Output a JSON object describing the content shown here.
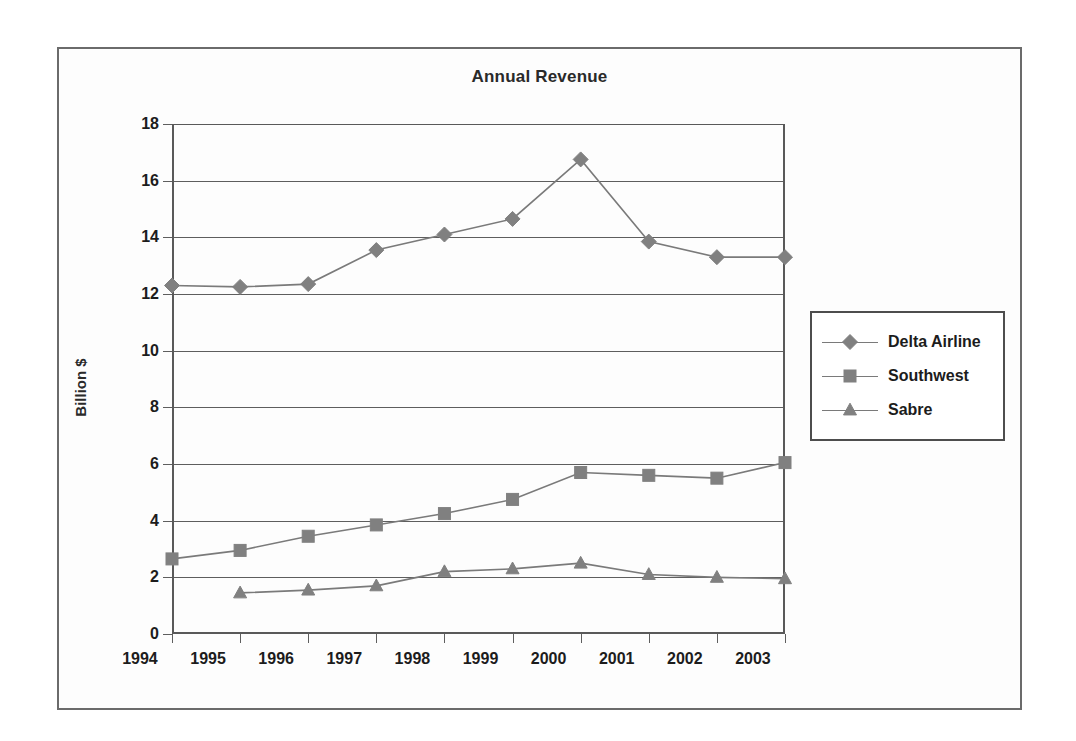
{
  "chart_data": {
    "type": "line",
    "title": "Annual Revenue",
    "xlabel": "",
    "ylabel": "Billion $",
    "categories": [
      "1994",
      "1995",
      "1996",
      "1997",
      "1998",
      "1999",
      "2000",
      "2001",
      "2002",
      "2003"
    ],
    "ylim": [
      0,
      18
    ],
    "ytick_step": 2,
    "yticks": [
      "0",
      "2",
      "4",
      "6",
      "8",
      "10",
      "12",
      "14",
      "16",
      "18"
    ],
    "grid": "horizontal",
    "legend_position": "right",
    "series": [
      {
        "name": "Delta Airline",
        "marker": "diamond",
        "color": "#808080",
        "values": [
          12.3,
          12.25,
          12.35,
          13.55,
          14.1,
          14.65,
          16.75,
          13.85,
          13.3,
          13.3
        ]
      },
      {
        "name": "Southwest",
        "marker": "square",
        "color": "#808080",
        "values": [
          2.65,
          2.95,
          3.45,
          3.85,
          4.25,
          4.75,
          5.7,
          5.6,
          5.5,
          6.05
        ]
      },
      {
        "name": "Sabre",
        "marker": "triangle",
        "color": "#808080",
        "values": [
          null,
          1.45,
          1.55,
          1.7,
          2.2,
          2.3,
          2.5,
          2.1,
          2.0,
          1.95
        ]
      }
    ]
  },
  "legend": {
    "items": [
      {
        "label": "Delta Airline",
        "marker": "diamond"
      },
      {
        "label": "Southwest",
        "marker": "square"
      },
      {
        "label": "Sabre",
        "marker": "triangle"
      }
    ]
  },
  "colors": {
    "series": "#808080",
    "line": "#7a7a7a",
    "axis": "#595959",
    "frame": "#6b6b6b",
    "text": "#1c1c1c",
    "background": "#ffffff",
    "plot_background": "#fdfdfd"
  }
}
